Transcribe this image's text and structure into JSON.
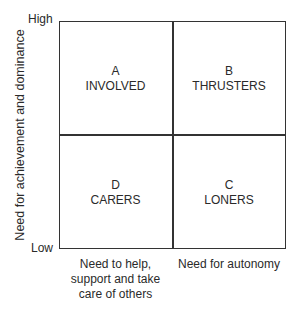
{
  "diagram": {
    "type": "2x2 matrix",
    "y_axis": {
      "label": "Need for achievement and dominance",
      "high_label": "High",
      "low_label": "Low"
    },
    "x_axis": {
      "left_label": "Need to help, support and take care of others",
      "right_label": "Need for autonomy"
    },
    "quadrants": {
      "top_left": {
        "letter": "A",
        "name": "INVOLVED"
      },
      "top_right": {
        "letter": "B",
        "name": "THRUSTERS"
      },
      "bottom_left": {
        "letter": "D",
        "name": "CARERS"
      },
      "bottom_right": {
        "letter": "C",
        "name": "LONERS"
      }
    }
  }
}
